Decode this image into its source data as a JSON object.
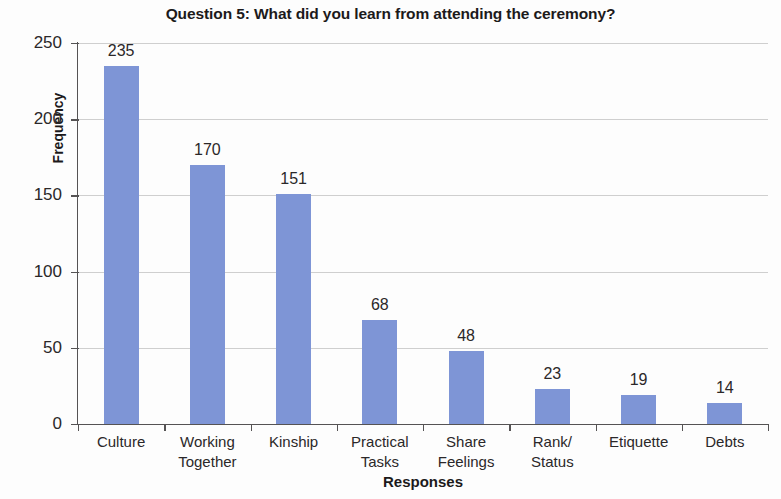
{
  "chart_data": {
    "type": "bar",
    "title": "Question 5: What did you learn from attending the ceremony?",
    "xlabel": "Responses",
    "ylabel": "Frequency",
    "categories": [
      "Culture",
      "Working Together",
      "Kinship",
      "Practical Tasks",
      "Share Feelings",
      "Rank/ Status",
      "Etiquette",
      "Debts"
    ],
    "category_lines": [
      [
        "Culture"
      ],
      [
        "Working",
        "Together"
      ],
      [
        "Kinship"
      ],
      [
        "Practical",
        "Tasks"
      ],
      [
        "Share",
        "Feelings"
      ],
      [
        "Rank/",
        "Status"
      ],
      [
        "Etiquette"
      ],
      [
        "Debts"
      ]
    ],
    "values": [
      235,
      170,
      151,
      68,
      48,
      23,
      19,
      14
    ],
    "value_labels": [
      "235",
      "170",
      "151",
      "68",
      "48",
      "23",
      "19",
      "14"
    ],
    "ylim": [
      0,
      250
    ],
    "yticks": [
      0,
      50,
      100,
      150,
      200,
      250
    ],
    "ytick_labels": [
      "0",
      "50",
      "100",
      "150",
      "200",
      "250"
    ],
    "grid": true,
    "legend": false,
    "bar_color": "#7e95d6",
    "grid_color": "#cfcfcf",
    "axis_color": "#555354",
    "text_color": "#2b2829",
    "background": "#fdfdfd"
  }
}
